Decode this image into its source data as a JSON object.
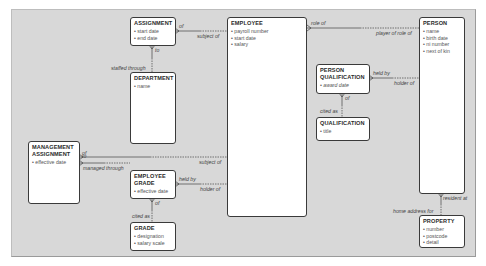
{
  "diagram": {
    "type": "entity-relationship",
    "entities": [
      {
        "id": "assignment",
        "name": "ASSIGNMENT",
        "attributes": [
          "start date",
          "end date"
        ]
      },
      {
        "id": "employee",
        "name": "EMPLOYEE",
        "attributes": [
          "payroll number",
          "start date",
          "salary"
        ]
      },
      {
        "id": "person",
        "name": "PERSON",
        "attributes": [
          "name",
          "birth date",
          "ni number",
          "next of kin"
        ]
      },
      {
        "id": "department",
        "name": "DEPARTMENT",
        "attributes": [
          "name"
        ]
      },
      {
        "id": "person_qualification",
        "name": "PERSON QUALIFICATION",
        "name_lines": [
          "PERSON",
          "QUALIFICATION"
        ],
        "attributes": [
          "award date"
        ]
      },
      {
        "id": "qualification",
        "name": "QUALIFICATION",
        "attributes": [
          "title"
        ]
      },
      {
        "id": "management_assignment",
        "name": "MANAGEMENT ASSIGNMENT",
        "name_lines": [
          "MANAGEMENT",
          "ASSIGNMENT"
        ],
        "attributes": [
          "effective date"
        ]
      },
      {
        "id": "employee_grade",
        "name": "EMPLOYEE GRADE",
        "name_lines": [
          "EMPLOYEE",
          "GRADE"
        ],
        "attributes": [
          "effective date"
        ]
      },
      {
        "id": "grade",
        "name": "GRADE",
        "attributes": [
          "designation",
          "salary scale"
        ]
      },
      {
        "id": "property",
        "name": "PROPERTY",
        "attributes": [
          "number",
          "postcode",
          "detail"
        ]
      }
    ],
    "relationships": [
      {
        "from": "assignment",
        "to": "employee",
        "from_label": "of",
        "to_label": "subject of"
      },
      {
        "from": "assignment",
        "to": "department",
        "from_label": "to",
        "to_label": "staffed through"
      },
      {
        "from": "employee",
        "to": "person",
        "from_label": "role of",
        "to_label": "player of role of"
      },
      {
        "from": "person_qualification",
        "to": "person",
        "from_label": "held by",
        "to_label": "holder of"
      },
      {
        "from": "person_qualification",
        "to": "qualification",
        "from_label": "of",
        "to_label": "cited as"
      },
      {
        "from": "management_assignment",
        "to": "department",
        "from_label": "to",
        "to_label": "managed through"
      },
      {
        "from": "management_assignment",
        "to": "employee",
        "from_label": "of",
        "to_label": "subject of"
      },
      {
        "from": "employee_grade",
        "to": "employee",
        "from_label": "held by",
        "to_label": "holder of"
      },
      {
        "from": "employee_grade",
        "to": "grade",
        "from_label": "of",
        "to_label": "cited as"
      },
      {
        "from": "person",
        "to": "property",
        "from_label": "resident at",
        "to_label": "home address for"
      }
    ]
  }
}
